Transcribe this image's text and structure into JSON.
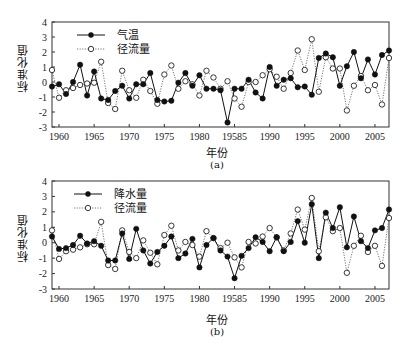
{
  "chart_data": [
    {
      "type": "line",
      "title": "",
      "caption": "(a)",
      "xlabel": "年份",
      "ylabel": "标准化值",
      "ylim": [
        -3,
        4
      ],
      "yticks": [
        -3,
        -2,
        -1,
        0,
        1,
        2,
        3,
        4
      ],
      "xticks": [
        1960,
        1965,
        1970,
        1975,
        1980,
        1985,
        1990,
        1995,
        2000,
        2005
      ],
      "xtick_labels": [
        "1960",
        "1965",
        "1970",
        "1975",
        "1980",
        "19585",
        "1990",
        "1995",
        "2000",
        "2005"
      ],
      "legend_position": "upper left",
      "grid": false,
      "x": [
        1959,
        1960,
        1961,
        1962,
        1963,
        1964,
        1965,
        1966,
        1967,
        1968,
        1969,
        1970,
        1971,
        1972,
        1973,
        1974,
        1975,
        1976,
        1977,
        1978,
        1979,
        1980,
        1981,
        1982,
        1983,
        1984,
        1985,
        1986,
        1987,
        1988,
        1989,
        1990,
        1991,
        1992,
        1993,
        1994,
        1995,
        1996,
        1997,
        1998,
        1999,
        2000,
        2001,
        2002,
        2003,
        2004,
        2005,
        2006,
        2007
      ],
      "series": [
        {
          "name": "气温",
          "style": "solid line, filled circle",
          "values": [
            -0.3,
            -0.15,
            -0.8,
            0.0,
            1.15,
            -0.9,
            0.7,
            -1.1,
            -1.2,
            -0.6,
            -0.25,
            -1.1,
            -0.15,
            -0.15,
            0.6,
            -1.2,
            -1.3,
            -1.25,
            -0.05,
            0.6,
            -0.25,
            0.45,
            -0.45,
            -0.45,
            -0.55,
            -2.7,
            -0.45,
            -0.45,
            0.15,
            -0.7,
            -1.1,
            1.0,
            -0.25,
            0.15,
            0.25,
            -0.35,
            -0.3,
            -0.85,
            1.6,
            1.9,
            1.65,
            -0.25,
            1.05,
            2.0,
            0.25,
            1.5,
            0.5,
            1.8,
            2.1
          ]
        },
        {
          "name": "径流量",
          "style": "dotted line, open circle",
          "values": [
            0.8,
            -1.05,
            -0.55,
            -0.4,
            -0.2,
            -0.1,
            -0.05,
            1.35,
            -1.4,
            -1.8,
            0.75,
            -0.55,
            -1.05,
            0.15,
            -0.6,
            -1.45,
            0.5,
            1.1,
            -0.45,
            0.05,
            -0.15,
            -0.9,
            0.75,
            0.3,
            -0.45,
            0.05,
            -1.1,
            -1.65,
            0.0,
            0.0,
            0.45,
            0.85,
            0.35,
            -0.45,
            0.6,
            2.1,
            0.8,
            2.85,
            -0.65,
            1.65,
            0.9,
            0.9,
            -1.9,
            -0.25,
            0.4,
            -0.55,
            -0.2,
            -1.5,
            1.6
          ]
        }
      ]
    },
    {
      "type": "line",
      "title": "",
      "caption": "(b)",
      "xlabel": "年份",
      "ylabel": "标准化值",
      "ylim": [
        -3,
        4
      ],
      "yticks": [
        -3,
        -2,
        -1,
        0,
        1,
        2,
        3,
        4
      ],
      "xticks": [
        1960,
        1965,
        1970,
        1975,
        1980,
        1985,
        1990,
        1995,
        2000,
        2005
      ],
      "xtick_labels": [
        "1960",
        "1965",
        "1970",
        "1975",
        "1980",
        "19585",
        "1990",
        "1995",
        "2000",
        "2005"
      ],
      "legend_position": "upper left",
      "grid": false,
      "x": [
        1959,
        1960,
        1961,
        1962,
        1963,
        1964,
        1965,
        1966,
        1967,
        1968,
        1969,
        1970,
        1971,
        1972,
        1973,
        1974,
        1975,
        1976,
        1977,
        1978,
        1979,
        1980,
        1981,
        1982,
        1983,
        1984,
        1985,
        1986,
        1987,
        1988,
        1989,
        1990,
        1991,
        1992,
        1993,
        1994,
        1995,
        1996,
        1997,
        1998,
        1999,
        2000,
        2001,
        2002,
        2003,
        2004,
        2005,
        2006,
        2007
      ],
      "series": [
        {
          "name": "降水量",
          "style": "solid line, filled circle",
          "values": [
            0.4,
            -0.4,
            -0.35,
            -0.15,
            0.45,
            -0.05,
            0.1,
            -0.2,
            -1.15,
            -1.15,
            0.6,
            -1.05,
            0.9,
            -0.5,
            -1.35,
            -0.6,
            -0.2,
            0.4,
            -1.0,
            -0.7,
            0.25,
            -1.6,
            -0.15,
            0.3,
            -0.5,
            -0.9,
            -2.3,
            -0.85,
            -0.35,
            0.35,
            0.05,
            -0.55,
            0.35,
            -0.55,
            0.05,
            1.4,
            0.0,
            2.5,
            -1.0,
            1.95,
            0.95,
            2.3,
            -0.3,
            1.7,
            0.1,
            -0.35,
            0.8,
            0.95,
            2.15
          ]
        },
        {
          "name": "径流量",
          "style": "dotted line, open circle",
          "values": [
            0.8,
            -1.05,
            -0.55,
            -0.45,
            -0.3,
            -0.1,
            -0.1,
            1.35,
            -1.45,
            -1.7,
            0.8,
            -0.6,
            -1.0,
            0.15,
            -0.65,
            -1.4,
            0.5,
            1.1,
            -0.5,
            0.05,
            -0.15,
            -0.9,
            0.75,
            0.3,
            -0.35,
            0.0,
            -0.95,
            -1.6,
            0.05,
            -0.05,
            0.4,
            0.95,
            0.35,
            -0.5,
            0.6,
            2.15,
            0.85,
            2.9,
            -0.55,
            1.65,
            0.75,
            0.95,
            -1.95,
            -0.2,
            0.45,
            -0.6,
            -0.2,
            -1.5,
            1.6
          ]
        }
      ]
    }
  ],
  "panel_a": {
    "ylabel": "标准化值",
    "xlabel": "年份",
    "caption": "(a)",
    "legend": [
      "气温",
      "径流量"
    ]
  },
  "panel_b": {
    "ylabel": "标准化值",
    "xlabel": "年份",
    "caption": "(b)",
    "legend": [
      "降水量",
      "径流量"
    ]
  }
}
